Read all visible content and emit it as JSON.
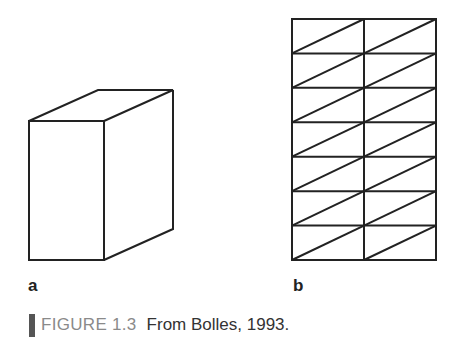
{
  "figure": {
    "panels": [
      {
        "id": "a",
        "label": "a",
        "content": "line drawing of a rectangular box (cuboid) in oblique view"
      },
      {
        "id": "b",
        "label": "b",
        "content": "2-column by 7-row grid of rectangles, each cell split by a diagonal line"
      }
    ],
    "caption": {
      "tag": "FIGURE 1.3",
      "text": "From Bolles, 1993."
    },
    "grid": {
      "columns": 2,
      "rows": 7
    },
    "colors": {
      "line": "#222222",
      "caption_tag": "#8a8a8a",
      "caption_bar": "#555555"
    }
  }
}
